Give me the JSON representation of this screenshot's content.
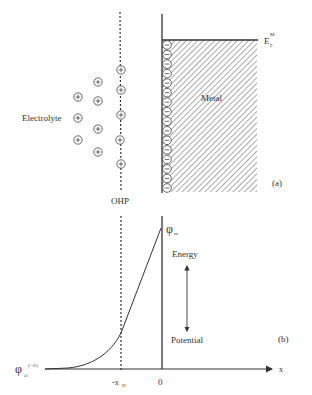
{
  "panel_a": {
    "electrolyte_label": "Electrolyte",
    "metal_label": "Metal",
    "ohp_label": "OHP",
    "fermi_label_main": "E",
    "fermi_label_sup": "M",
    "fermi_label_sub": "F",
    "panel_tag": "(a)",
    "cation_symbol": "+",
    "electron_symbol": "−",
    "cations": [
      {
        "x": 121,
        "y": 70
      },
      {
        "x": 121,
        "y": 90
      },
      {
        "x": 121,
        "y": 115
      },
      {
        "x": 120,
        "y": 140
      },
      {
        "x": 121,
        "y": 164
      },
      {
        "x": 98,
        "y": 82
      },
      {
        "x": 98,
        "y": 101
      },
      {
        "x": 98,
        "y": 129
      },
      {
        "x": 98,
        "y": 152
      },
      {
        "x": 78,
        "y": 97
      },
      {
        "x": 78,
        "y": 118
      },
      {
        "x": 78,
        "y": 140
      }
    ],
    "electron_count": 16
  },
  "panel_b": {
    "phi_m_main": "φ",
    "phi_m_sub": "m",
    "phi_el_main": "φ",
    "phi_el_sub": "el",
    "phi_el_sup": "(−∞)",
    "energy_label": "Energy",
    "potential_label": "Potential",
    "x_axis_label": "x",
    "origin_label": "0",
    "xh_main": "-x",
    "xh_sub": "H",
    "panel_tag": "(b)"
  },
  "colors": {
    "line": "#333333",
    "hatch": "#555555",
    "background": "#ffffff"
  }
}
